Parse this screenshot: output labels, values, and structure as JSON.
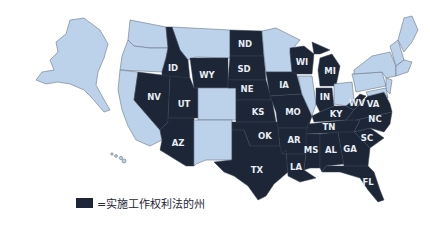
{
  "map": {
    "colors": {
      "right_to_work": "#1c2637",
      "other": "#bcd1ea",
      "label": "#e8eef6"
    },
    "state_labels": [
      {
        "id": "ND",
        "x": 245,
        "y": 44
      },
      {
        "id": "SD",
        "x": 244,
        "y": 69
      },
      {
        "id": "NE",
        "x": 247,
        "y": 89
      },
      {
        "id": "KS",
        "x": 258,
        "y": 113
      },
      {
        "id": "OK",
        "x": 266,
        "y": 136
      },
      {
        "id": "TX",
        "x": 257,
        "y": 170
      },
      {
        "id": "ID",
        "x": 173,
        "y": 68
      },
      {
        "id": "WY",
        "x": 206,
        "y": 75
      },
      {
        "id": "NV",
        "x": 154,
        "y": 97
      },
      {
        "id": "UT",
        "x": 184,
        "y": 104
      },
      {
        "id": "AZ",
        "x": 178,
        "y": 143
      },
      {
        "id": "WI",
        "x": 302,
        "y": 62
      },
      {
        "id": "MI",
        "x": 330,
        "y": 71
      },
      {
        "id": "IA",
        "x": 284,
        "y": 85
      },
      {
        "id": "MO",
        "x": 294,
        "y": 113
      },
      {
        "id": "IN",
        "x": 326,
        "y": 97
      },
      {
        "id": "KY",
        "x": 337,
        "y": 113
      },
      {
        "id": "WV",
        "x": 357,
        "y": 103
      },
      {
        "id": "VA",
        "x": 373,
        "y": 104
      },
      {
        "id": "NC",
        "x": 375,
        "y": 119
      },
      {
        "id": "TN",
        "x": 329,
        "y": 128
      },
      {
        "id": "SC",
        "x": 367,
        "y": 138
      },
      {
        "id": "AR",
        "x": 294,
        "y": 139
      },
      {
        "id": "MS",
        "x": 311,
        "y": 150
      },
      {
        "id": "AL",
        "x": 331,
        "y": 150
      },
      {
        "id": "GA",
        "x": 350,
        "y": 149
      },
      {
        "id": "LA",
        "x": 296,
        "y": 167
      },
      {
        "id": "FL",
        "x": 368,
        "y": 181
      }
    ]
  },
  "legend": {
    "label": "=实施工作权利法的州"
  }
}
